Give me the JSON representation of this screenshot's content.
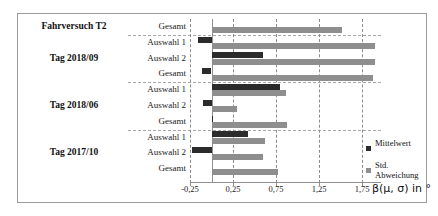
{
  "chart_data": {
    "type": "bar",
    "orientation": "horizontal",
    "title": "",
    "xlabel": "β(μ, σ) in °",
    "ylabel": "",
    "xlim": [
      -0.25,
      1.9
    ],
    "xticks": [
      -0.25,
      0.25,
      0.75,
      1.25,
      1.75
    ],
    "xticklabels": [
      "-0,25",
      "0,25",
      "0,75",
      "1,25",
      "1,75"
    ],
    "grid": true,
    "legend_position": "right",
    "groups": [
      {
        "label": "Fahrversuch T2",
        "rows": [
          {
            "label": "Gesamt",
            "mean": 0.0,
            "std": 1.52
          }
        ]
      },
      {
        "label": "Tag 2018/09",
        "rows": [
          {
            "label": "Auswahl 1",
            "mean": -0.16,
            "std": 1.9
          },
          {
            "label": "Auswahl 2",
            "mean": 0.6,
            "std": 1.9
          },
          {
            "label": "Gesamt",
            "mean": -0.11,
            "std": 1.88
          }
        ]
      },
      {
        "label": "Tag 2018/06",
        "rows": [
          {
            "label": "Auswahl 1",
            "mean": 0.8,
            "std": 0.86
          },
          {
            "label": "Auswahl 2",
            "mean": -0.1,
            "std": 0.3
          },
          {
            "label": "Gesamt",
            "mean": 0.02,
            "std": 0.88
          }
        ]
      },
      {
        "label": "Tag 2017/10",
        "rows": [
          {
            "label": "Auswahl 1",
            "mean": 0.42,
            "std": 0.62
          },
          {
            "label": "Auswahl 2",
            "mean": -0.23,
            "std": 0.6
          },
          {
            "label": "Gesamt",
            "mean": 0.0,
            "std": 0.77
          }
        ]
      }
    ],
    "series": [
      {
        "name": "Mittelwert",
        "color": "#2b2b2b"
      },
      {
        "name": "Std. Abweichung",
        "color": "#8e8e8e"
      }
    ]
  },
  "legend": {
    "items": [
      {
        "label": "Mittelwert"
      },
      {
        "label": "Std. Abweichung"
      }
    ]
  }
}
